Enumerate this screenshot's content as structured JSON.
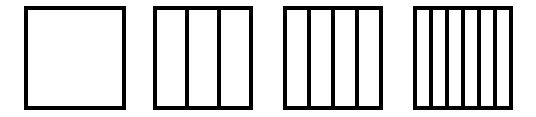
{
  "diagram": {
    "stroke_color": "#000000",
    "background": "#ffffff",
    "stroke_width": 4,
    "shapes": [
      {
        "id": "square-1",
        "x": 26,
        "y": 8,
        "width": 98,
        "height": 100,
        "parts": 1
      },
      {
        "id": "square-2",
        "x": 155,
        "y": 8,
        "width": 96,
        "height": 100,
        "parts": 3
      },
      {
        "id": "square-3",
        "x": 285,
        "y": 8,
        "width": 96,
        "height": 100,
        "parts": 4
      },
      {
        "id": "square-4",
        "x": 415,
        "y": 8,
        "width": 96,
        "height": 100,
        "parts": 6
      }
    ]
  }
}
